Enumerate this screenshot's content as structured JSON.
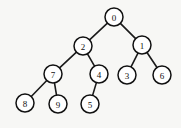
{
  "diagram": {
    "type": "binary-tree",
    "background_color": "#f7f7f5",
    "node_fill_color": "#ffffff",
    "node_stroke_color": "#111111",
    "edge_color": "#1a1a1a",
    "node_radius": 9,
    "nodes": [
      {
        "id": "n0",
        "label": "0",
        "cx": 114,
        "cy": 17,
        "depth": 0
      },
      {
        "id": "n2",
        "label": "2",
        "cx": 83,
        "cy": 46,
        "depth": 1
      },
      {
        "id": "n1",
        "label": "1",
        "cx": 142,
        "cy": 45,
        "depth": 1
      },
      {
        "id": "n7",
        "label": "7",
        "cx": 53,
        "cy": 74,
        "depth": 2
      },
      {
        "id": "n4",
        "label": "4",
        "cx": 99,
        "cy": 74,
        "depth": 2
      },
      {
        "id": "n3",
        "label": "3",
        "cx": 127,
        "cy": 75,
        "depth": 2
      },
      {
        "id": "n6",
        "label": "6",
        "cx": 162,
        "cy": 75,
        "depth": 2
      },
      {
        "id": "n8",
        "label": "8",
        "cx": 25,
        "cy": 103,
        "depth": 3
      },
      {
        "id": "n9",
        "label": "9",
        "cx": 58,
        "cy": 104,
        "depth": 3
      },
      {
        "id": "n5",
        "label": "5",
        "cx": 90,
        "cy": 104,
        "depth": 3
      }
    ],
    "edges": [
      {
        "from": "n0",
        "to": "n2",
        "x1": 114,
        "y1": 17,
        "x2": 83,
        "y2": 46
      },
      {
        "from": "n0",
        "to": "n1",
        "x1": 114,
        "y1": 17,
        "x2": 142,
        "y2": 45
      },
      {
        "from": "n2",
        "to": "n7",
        "x1": 83,
        "y1": 46,
        "x2": 53,
        "y2": 74
      },
      {
        "from": "n2",
        "to": "n4",
        "x1": 83,
        "y1": 46,
        "x2": 99,
        "y2": 74
      },
      {
        "from": "n1",
        "to": "n3",
        "x1": 142,
        "y1": 45,
        "x2": 127,
        "y2": 75
      },
      {
        "from": "n1",
        "to": "n6",
        "x1": 142,
        "y1": 45,
        "x2": 162,
        "y2": 75
      },
      {
        "from": "n7",
        "to": "n8",
        "x1": 53,
        "y1": 74,
        "x2": 25,
        "y2": 103
      },
      {
        "from": "n7",
        "to": "n9",
        "x1": 53,
        "y1": 74,
        "x2": 58,
        "y2": 104
      },
      {
        "from": "n4",
        "to": "n5",
        "x1": 99,
        "y1": 74,
        "x2": 90,
        "y2": 104
      }
    ]
  }
}
